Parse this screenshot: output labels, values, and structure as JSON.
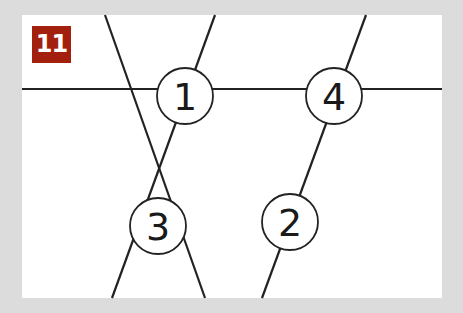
{
  "badge": {
    "label": "11",
    "color": "#a3200f"
  },
  "colors": {
    "background": "#dcdcdc",
    "panel": "#ffffff",
    "line": "#222222"
  },
  "panel": {
    "x": 22,
    "y": 15,
    "width": 420,
    "height": 283
  },
  "lines": [
    {
      "id": "horizontal",
      "x1": 22,
      "y1": 89,
      "x2": 442,
      "y2": 89
    },
    {
      "id": "diag-a",
      "x1": 105,
      "y1": 15,
      "x2": 205,
      "y2": 298
    },
    {
      "id": "diag-b",
      "x1": 215,
      "y1": 15,
      "x2": 112,
      "y2": 298
    },
    {
      "id": "diag-c",
      "x1": 366,
      "y1": 15,
      "x2": 262,
      "y2": 298
    }
  ],
  "nodes": [
    {
      "label": "1",
      "cx": 185,
      "cy": 96,
      "r": 28
    },
    {
      "label": "2",
      "cx": 290,
      "cy": 222,
      "r": 28
    },
    {
      "label": "3",
      "cx": 158,
      "cy": 226,
      "r": 28
    },
    {
      "label": "4",
      "cx": 334,
      "cy": 96,
      "r": 28
    }
  ]
}
